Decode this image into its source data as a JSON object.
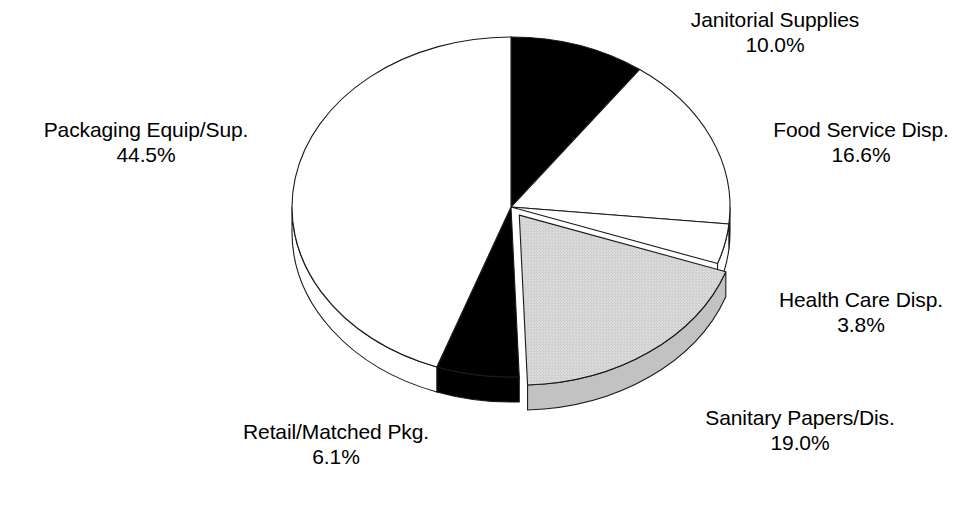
{
  "chart_data": {
    "type": "pie",
    "title": "",
    "subtitle": "",
    "xlabel": "",
    "ylabel": "",
    "grid": false,
    "legend_position": "none",
    "label_format": "name above percentage",
    "three_d": true,
    "start_angle_deg": 0,
    "direction": "clockwise",
    "categories": [
      "Janitorial Supplies",
      "Food Service Disp.",
      "Health Care Disp.",
      "Sanitary Papers/Dis.",
      "Retail/Matched Pkg.",
      "Packaging Equip/Sup."
    ],
    "values": [
      10.0,
      16.6,
      3.8,
      19.0,
      6.1,
      44.5
    ],
    "units": "%",
    "total": 100.0,
    "slices": [
      {
        "name": "Janitorial Supplies",
        "label": "Janitorial Supplies",
        "value": 10.0,
        "value_text": "10.0%",
        "color": "#000000",
        "fill": "black",
        "exploded": false,
        "start_deg": 0.0,
        "end_deg": 36.0
      },
      {
        "name": "Food Service Disp.",
        "label": "Food Service Disp.",
        "value": 16.6,
        "value_text": "16.6%",
        "color": "#ffffff",
        "fill": "white",
        "exploded": false,
        "start_deg": 36.0,
        "end_deg": 95.76
      },
      {
        "name": "Health Care Disp.",
        "label": "Health Care Disp.",
        "value": 3.8,
        "value_text": "3.8%",
        "color": "#ffffff",
        "fill": "white",
        "exploded": false,
        "start_deg": 95.76,
        "end_deg": 109.44
      },
      {
        "name": "Sanitary Papers/Dis.",
        "label": "Sanitary Papers/Dis.",
        "value": 19.0,
        "value_text": "19.0%",
        "color": "#d4d4d4",
        "fill": "light-gray",
        "exploded": true,
        "start_deg": 109.44,
        "end_deg": 177.84
      },
      {
        "name": "Retail/Matched Pkg.",
        "label": "Retail/Matched Pkg.",
        "value": 6.1,
        "value_text": "6.1%",
        "color": "#000000",
        "fill": "black",
        "exploded": false,
        "start_deg": 177.84,
        "end_deg": 199.8
      },
      {
        "name": "Packaging Equip/Sup.",
        "label": "Packaging Equip/Sup.",
        "value": 44.5,
        "value_text": "44.5%",
        "color": "#ffffff",
        "fill": "white",
        "exploded": false,
        "start_deg": 199.8,
        "end_deg": 360.0
      }
    ]
  },
  "colors": {
    "background": "#ffffff",
    "outline": "#1a1a1a",
    "black_slice": "#000000",
    "white_slice": "#ffffff",
    "gray_slice": "#d4d4d4",
    "gray_slice_side": "#c2c2c2",
    "text": "#000000"
  },
  "geometry": {
    "center_x": 511,
    "center_y": 207,
    "radius_x": 219,
    "radius_y": 170,
    "depth": 25
  }
}
